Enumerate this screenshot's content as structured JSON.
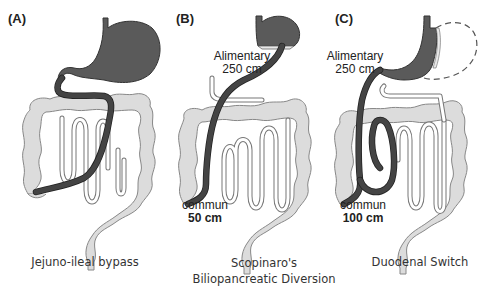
{
  "panels": [
    {
      "id": "A",
      "label": "(A)",
      "caption_lines": [
        "Jejuno-ileal bypass"
      ],
      "annotations": []
    },
    {
      "id": "B",
      "label": "(B)",
      "caption_lines": [
        "Scopinaro's",
        "Biliopancreatic Diversion"
      ],
      "annotations": [
        {
          "text": "Alimentary",
          "weight": "normal"
        },
        {
          "text": "250 cm",
          "weight": "normal"
        },
        {
          "text": "commun",
          "weight": "normal"
        },
        {
          "text": "50 cm",
          "weight": "bold"
        }
      ]
    },
    {
      "id": "C",
      "label": "(C)",
      "caption_lines": [
        "Duodenal Switch"
      ],
      "annotations": [
        {
          "text": "Alimentary",
          "weight": "normal"
        },
        {
          "text": "250 cm",
          "weight": "normal"
        },
        {
          "text": "commun",
          "weight": "normal"
        },
        {
          "text": "100 cm",
          "weight": "bold"
        }
      ]
    }
  ],
  "colors": {
    "stomach": "#5a5a5a",
    "colon": "#dcdcdc",
    "alimentary_limb": "#444444",
    "background": "#ffffff"
  }
}
